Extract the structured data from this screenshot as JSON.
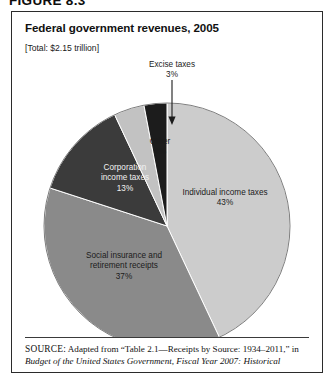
{
  "figure": {
    "label": "FIGURE 8.3",
    "title": "Federal government revenues, 2005",
    "subtitle": "[Total: $2.15 trillion]"
  },
  "source": {
    "prefix": "SOURCE:",
    "line1": " Adapted from “Table 2.1—Receipts by Source: 1934–2011,” in",
    "line2": "Budget of the United States Government, Fiscal Year 2007: Historical"
  },
  "chart_data": {
    "type": "pie",
    "title": "Federal government revenues, 2005",
    "subtitle": "[Total: $2.15 trillion]",
    "total": "$2.15 trillion",
    "legend": "none (direct slice labels)",
    "grid": false,
    "categories": [
      "Individual income taxes",
      "Social insurance and retirement receipts",
      "Corporation income taxes",
      "Other",
      "Excise taxes"
    ],
    "values": [
      43,
      37,
      13,
      4,
      3
    ],
    "unit": "%",
    "slices": [
      {
        "name": "Individual income taxes",
        "label_line1": "Individual income taxes",
        "label_line2": "43%",
        "value": 43,
        "value_text": "43%",
        "color": "#cccccc",
        "label_placement": "inside",
        "label_color": "on-light",
        "lx": 213,
        "ly": 140,
        "start_deg": 0,
        "end_deg": 154.8
      },
      {
        "name": "Social insurance and retirement receipts",
        "label_line1": "Social insurance and",
        "label_line2": "retirement receipts",
        "label_line3": "37%",
        "value": 37,
        "value_text": "37%",
        "color": "#8a8a8a",
        "label_placement": "inside",
        "label_color": "on-light",
        "lx": 112,
        "ly": 208,
        "start_deg": 154.8,
        "end_deg": 288.0
      },
      {
        "name": "Corporation income taxes",
        "label_line1": "Corporation",
        "label_line2": "income taxes",
        "label_line3": "13%",
        "value": 13,
        "value_text": "13%",
        "color": "#3b3b3b",
        "label_placement": "inside",
        "label_color": "on-dark",
        "lx": 113,
        "ly": 120,
        "start_deg": 288.0,
        "end_deg": 334.8
      },
      {
        "name": "Other",
        "label_line1": "Other",
        "label_line2": "4%",
        "value": 4,
        "value_text": "4%",
        "color": "#c2c2c2",
        "label_placement": "inside",
        "label_color": "on-light",
        "lx": 148,
        "ly": 89,
        "start_deg": 334.8,
        "end_deg": 349.2
      },
      {
        "name": "Excise taxes",
        "label_line1": "Excise taxes",
        "label_line2": "3%",
        "value": 3,
        "value_text": "3%",
        "color": "#1c1c1c",
        "label_placement": "callout",
        "label_color": "on-light",
        "lx": 160,
        "ly": 12,
        "start_deg": 349.2,
        "end_deg": 360.0
      }
    ]
  }
}
